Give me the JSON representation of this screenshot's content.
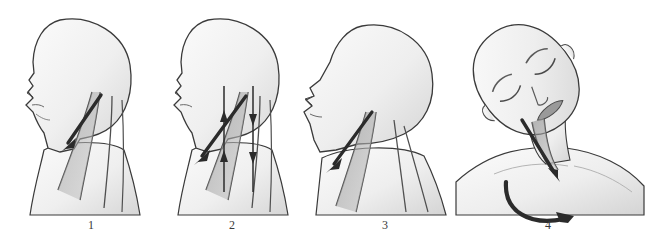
{
  "figure": {
    "background_color": "#ffffff",
    "body_fill": "#f1f1f1",
    "body_fill_dark": "#dcdcdc",
    "outline_color": "#3a3a3a",
    "muscle_color": "#9a9a9a",
    "muscle_color_dark": "#6e6e6e",
    "arrow_color": "#2b2b2b",
    "panel_count": 4
  },
  "captions": [
    {
      "label": "1"
    },
    {
      "label": "2"
    },
    {
      "label": "3"
    },
    {
      "label": "4"
    }
  ],
  "panels": [
    {
      "number": "1",
      "view": "left lateral profile",
      "posture": "neutral head position, face forward",
      "icons": [
        "head-profile-icon",
        "neck-muscle-icon",
        "straight-arrow-down-left-icon"
      ],
      "arrows": [
        {
          "type": "straight",
          "direction": "down-left",
          "meaning": "sternocleidomastoid stretch direction"
        }
      ],
      "muscle_band_count": 4
    },
    {
      "number": "2",
      "view": "left lateral profile",
      "posture": "neutral head position with opposing tension lines",
      "icons": [
        "head-profile-icon",
        "neck-muscle-icon",
        "straight-arrow-down-left-icon",
        "vertical-tension-arrow-icon"
      ],
      "arrows": [
        {
          "type": "straight",
          "direction": "down-left",
          "meaning": "stretch direction"
        },
        {
          "type": "vertical",
          "direction": "up",
          "meaning": "muscle tension upward"
        },
        {
          "type": "vertical",
          "direction": "down",
          "meaning": "muscle tension downward"
        },
        {
          "type": "vertical",
          "direction": "up",
          "meaning": "muscle tension upward"
        },
        {
          "type": "vertical",
          "direction": "down",
          "meaning": "muscle tension downward"
        }
      ],
      "muscle_band_count": 4
    },
    {
      "number": "3",
      "view": "left lateral profile",
      "posture": "head tilted back in cervical extension, chin raised",
      "icons": [
        "head-profile-extended-icon",
        "neck-muscle-icon",
        "straight-arrow-down-left-icon"
      ],
      "arrows": [
        {
          "type": "straight",
          "direction": "down-left",
          "meaning": "anterior neck stretch direction"
        }
      ],
      "muscle_band_count": 4
    },
    {
      "number": "4",
      "view": "anterior frontal",
      "posture": "head laterally flexed and rotated, eyes closed",
      "icons": [
        "head-front-tilted-icon",
        "closed-eye-icon",
        "neck-muscle-icon",
        "straight-arrow-down-right-icon",
        "curved-rotation-arrow-icon"
      ],
      "arrows": [
        {
          "type": "straight",
          "direction": "down-right",
          "meaning": "lateral flexion pull"
        },
        {
          "type": "curved",
          "direction": "clockwise-sweep",
          "meaning": "head rotation direction"
        }
      ],
      "muscle_band_count": 2
    }
  ]
}
